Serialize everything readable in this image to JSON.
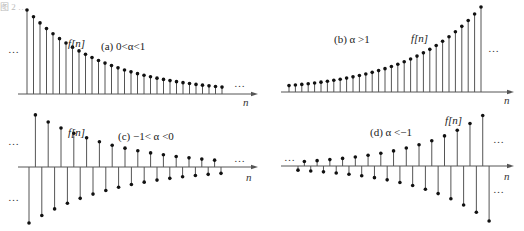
{
  "figure": {
    "top_caption_fragment": "图 2 …"
  },
  "chart_data": [
    {
      "id": "a",
      "type": "stem",
      "title": "(a) 0<α<1",
      "series_label": "f[n]",
      "xlabel": "n",
      "ellipsis_left": "…",
      "ellipsis_right": "…",
      "alpha_description": "decaying exponential, 0<alpha<1",
      "count": 31,
      "alpha": 0.92,
      "start_value": 1.0,
      "axis": {
        "x0": 18,
        "x1": 258,
        "y": 94,
        "stem_start_x": 27,
        "spacing": 6.5,
        "max_height": 84
      },
      "grid": false
    },
    {
      "id": "b",
      "type": "stem",
      "title": "(b) α >1",
      "series_label": "f[n]",
      "xlabel": "n",
      "ellipsis_right": "…",
      "alpha_description": "growing exponential, alpha>1",
      "count": 31,
      "alpha": 1.09,
      "axis": {
        "x0": 281,
        "x1": 514,
        "y": 92,
        "stem_start_x": 289,
        "spacing": 6.4,
        "max_height": 85
      },
      "grid": false
    },
    {
      "id": "c",
      "type": "stem",
      "title": "(c) −1< α <0",
      "series_label": "f[n]",
      "xlabel": "n",
      "ellipsis_left_top": "…",
      "ellipsis_left_bottom": "…",
      "ellipsis_right": "…",
      "alpha_description": "alternating decaying, -1<alpha<0",
      "count": 31,
      "alpha": -0.93,
      "axis": {
        "x0": 18,
        "x1": 258,
        "y": 167,
        "stem_start_x": 29,
        "spacing": 6.4,
        "max_height": 56
      },
      "grid": false
    },
    {
      "id": "d",
      "type": "stem",
      "title": "(d) α <−1",
      "series_label": "f[n]",
      "xlabel": "n",
      "ellipsis_left": "…",
      "ellipsis_right_top": "…",
      "ellipsis_right_bottom": "…",
      "alpha_description": "alternating growing, alpha<-1",
      "count": 31,
      "alpha": -1.09,
      "axis": {
        "x0": 281,
        "x1": 514,
        "y": 166,
        "stem_start_x": 298,
        "spacing": 6.37,
        "max_height": 55
      },
      "grid": false
    }
  ]
}
